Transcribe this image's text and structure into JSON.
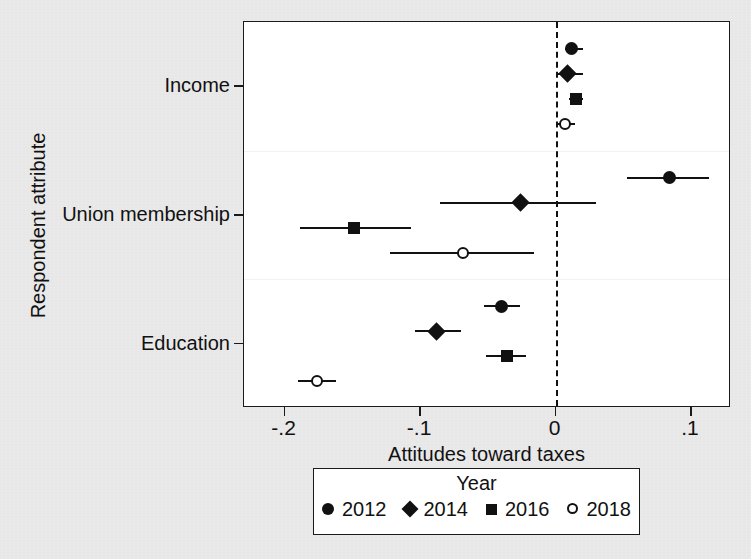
{
  "chart_data": {
    "type": "scatter",
    "title": "",
    "xlabel": "Attitudes toward taxes",
    "ylabel": "Respondent attribute",
    "xlim": [
      -0.23,
      0.1295
    ],
    "xticks": [
      -0.2,
      -0.1,
      0,
      0.1
    ],
    "xticklabels": [
      "-.2",
      "-.1",
      "0",
      ".1"
    ],
    "categories": [
      "Income",
      "Union membership",
      "Education"
    ],
    "grid": false,
    "reference_line": 0,
    "legend_position": "below",
    "legend_title": "Year",
    "series": [
      {
        "name": "2012",
        "marker": "filled-circle",
        "values": [
          0.012,
          0.084,
          -0.04
        ],
        "ci_low": [
          0.007,
          0.053,
          -0.053
        ],
        "ci_high": [
          0.02,
          0.113,
          -0.026
        ]
      },
      {
        "name": "2014",
        "marker": "filled-diamond",
        "values": [
          0.009,
          -0.026,
          -0.088
        ],
        "ci_low": [
          0.0,
          -0.085,
          -0.104
        ],
        "ci_high": [
          0.02,
          0.03,
          -0.07
        ]
      },
      {
        "name": "2016",
        "marker": "filled-square",
        "values": [
          0.015,
          -0.149,
          -0.036
        ],
        "ci_low": [
          0.01,
          -0.189,
          -0.051
        ],
        "ci_high": [
          0.02,
          -0.107,
          -0.022
        ]
      },
      {
        "name": "2018",
        "marker": "open-circle",
        "values": [
          0.007,
          -0.068,
          -0.176
        ],
        "ci_low": [
          0.001,
          -0.122,
          -0.19
        ],
        "ci_high": [
          0.014,
          -0.016,
          -0.162
        ]
      }
    ]
  },
  "axes": {
    "x_title": "Attitudes toward taxes",
    "y_title": "Respondent attribute",
    "x_tick_labels": [
      "-.2",
      "-.1",
      "0",
      ".1"
    ],
    "y_tick_labels": [
      "Income",
      "Union membership",
      "Education"
    ]
  },
  "legend": {
    "title": "Year",
    "entries": [
      {
        "label": "2012",
        "marker": "filled-circle"
      },
      {
        "label": "2014",
        "marker": "filled-diamond"
      },
      {
        "label": "2016",
        "marker": "filled-square"
      },
      {
        "label": "2018",
        "marker": "open-circle"
      }
    ]
  }
}
